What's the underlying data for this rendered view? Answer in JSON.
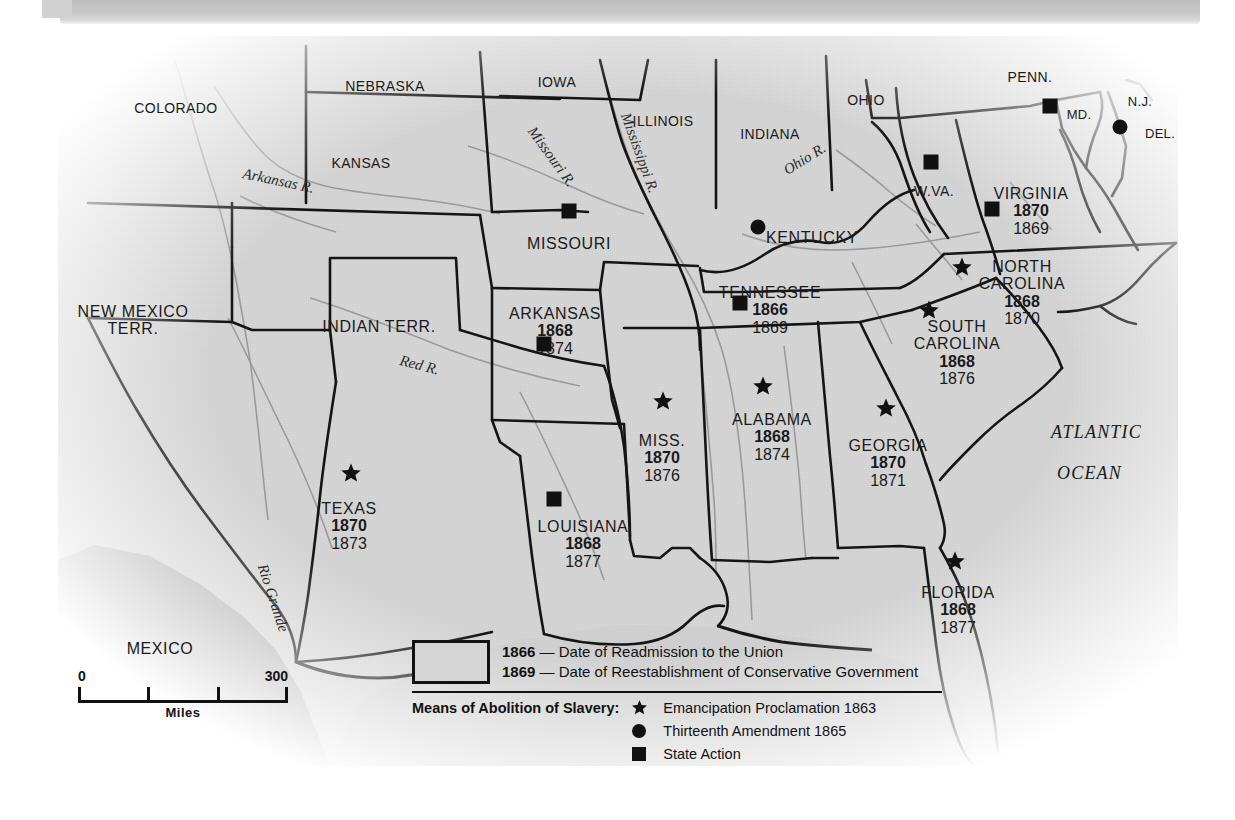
{
  "map": {
    "title_region": "Reconstruction of the South",
    "states": [
      {
        "name": "COLORADO",
        "x": 176,
        "y": 101,
        "y1": "",
        "y2": "",
        "marker": "none",
        "size": "sm"
      },
      {
        "name": "NEBRASKA",
        "x": 385,
        "y": 79,
        "y1": "",
        "y2": "",
        "marker": "none",
        "size": "sm"
      },
      {
        "name": "KANSAS",
        "x": 361,
        "y": 156,
        "y1": "",
        "y2": "",
        "marker": "none",
        "size": "sm"
      },
      {
        "name": "IOWA",
        "x": 557,
        "y": 75,
        "y1": "",
        "y2": "",
        "marker": "none",
        "size": "sm"
      },
      {
        "name": "ILLINOIS",
        "x": 663,
        "y": 114,
        "y1": "",
        "y2": "",
        "marker": "none",
        "size": "sm"
      },
      {
        "name": "INDIANA",
        "x": 770,
        "y": 127,
        "y1": "",
        "y2": "",
        "marker": "none",
        "size": "sm"
      },
      {
        "name": "OHIO",
        "x": 866,
        "y": 93,
        "y1": "",
        "y2": "",
        "marker": "none",
        "size": "sm"
      },
      {
        "name": "PENN.",
        "x": 1030,
        "y": 70,
        "y1": "",
        "y2": "",
        "marker": "none",
        "size": "sm"
      },
      {
        "name": "N.J.",
        "x": 1140,
        "y": 95,
        "y1": "",
        "y2": "",
        "marker": "none",
        "size": "xs"
      },
      {
        "name": "MD.",
        "x": 1079,
        "y": 108,
        "y1": "",
        "y2": "",
        "marker": "square",
        "mx": 1050,
        "my": 106,
        "size": "xs"
      },
      {
        "name": "DEL.",
        "x": 1160,
        "y": 127,
        "y1": "",
        "y2": "",
        "marker": "circle",
        "mx": 1120,
        "my": 127,
        "size": "xs"
      },
      {
        "name": "MISSOURI",
        "x": 569,
        "y": 235,
        "y1": "",
        "y2": "",
        "marker": "square",
        "mx": 569,
        "my": 211,
        "size": "nm"
      },
      {
        "name": "W.VA.",
        "x": 934,
        "y": 184,
        "y1": "",
        "y2": "",
        "marker": "square",
        "mx": 931,
        "my": 162,
        "size": "sm"
      },
      {
        "name": "VIRGINIA",
        "x": 1031,
        "y": 185,
        "y1": "1870",
        "y2": "1869",
        "marker": "square",
        "mx": 992,
        "my": 209,
        "size": "nm"
      },
      {
        "name": "KENTUCKY",
        "x": 812,
        "y": 229,
        "y1": "",
        "y2": "",
        "marker": "circle",
        "mx": 758,
        "my": 227,
        "size": "nm"
      },
      {
        "name": "NEW MEXICO",
        "x": 133,
        "y": 303,
        "y1": "",
        "y2": "",
        "marker": "none",
        "size": "nm",
        "name2": "TERR."
      },
      {
        "name": "INDIAN TERR.",
        "x": 379,
        "y": 318,
        "y1": "",
        "y2": "",
        "marker": "none",
        "size": "nm"
      },
      {
        "name": "ARKANSAS",
        "x": 555,
        "y": 305,
        "y1": "1868",
        "y2": "1874",
        "marker": "square",
        "mx": 544,
        "my": 344,
        "size": "nm"
      },
      {
        "name": "TENNESSEE",
        "x": 770,
        "y": 284,
        "y1": "1866",
        "y2": "1869",
        "marker": "square",
        "mx": 740,
        "my": 303,
        "size": "nm"
      },
      {
        "name": "NORTH",
        "x": 1022,
        "y": 258,
        "y1": "1868",
        "y2": "1870",
        "marker": "star",
        "mx": 962,
        "my": 267,
        "size": "nm",
        "name2": "CAROLINA"
      },
      {
        "name": "SOUTH",
        "x": 957,
        "y": 318,
        "y1": "1868",
        "y2": "1876",
        "marker": "star",
        "mx": 929,
        "my": 310,
        "size": "nm",
        "name2": "CAROLINA"
      },
      {
        "name": "MISS.",
        "x": 662,
        "y": 432,
        "y1": "1870",
        "y2": "1876",
        "marker": "star",
        "mx": 663,
        "my": 401,
        "size": "nm"
      },
      {
        "name": "ALABAMA",
        "x": 772,
        "y": 411,
        "y1": "1868",
        "y2": "1874",
        "marker": "star",
        "mx": 763,
        "my": 386,
        "size": "nm"
      },
      {
        "name": "GEORGIA",
        "x": 888,
        "y": 437,
        "y1": "1870",
        "y2": "1871",
        "marker": "star",
        "mx": 886,
        "my": 408,
        "size": "nm"
      },
      {
        "name": "TEXAS",
        "x": 349,
        "y": 500,
        "y1": "1870",
        "y2": "1873",
        "marker": "star",
        "mx": 351,
        "my": 473,
        "size": "nm"
      },
      {
        "name": "LOUISIANA",
        "x": 583,
        "y": 518,
        "y1": "1868",
        "y2": "1877",
        "marker": "square",
        "mx": 554,
        "my": 499,
        "size": "nm"
      },
      {
        "name": "FLORIDA",
        "x": 958,
        "y": 584,
        "y1": "1868",
        "y2": "1877",
        "marker": "star",
        "mx": 955,
        "my": 561,
        "size": "nm"
      },
      {
        "name": "MEXICO",
        "x": 160,
        "y": 640,
        "y1": "",
        "y2": "",
        "marker": "none",
        "size": "nm"
      }
    ],
    "rivers": [
      {
        "label": "Arkansas R.",
        "x": 243,
        "y": 165,
        "rot": 12
      },
      {
        "label": "Missouri R.",
        "x": 531,
        "y": 120,
        "rot": 54
      },
      {
        "label": "Mississippi R.",
        "x": 625,
        "y": 105,
        "rot": 70
      },
      {
        "label": "Ohio R.",
        "x": 785,
        "y": 163,
        "rot": -32
      },
      {
        "label": "Red R.",
        "x": 400,
        "y": 352,
        "rot": 14
      },
      {
        "label": "Rio Grande",
        "x": 262,
        "y": 556,
        "rot": 72
      }
    ],
    "ocean_labels": [
      {
        "label": "ATLANTIC",
        "x": 1051,
        "y": 422
      },
      {
        "label": "OCEAN",
        "x": 1057,
        "y": 463
      }
    ]
  },
  "scale": {
    "zero": "0",
    "max": "300",
    "unit": "Miles"
  },
  "legend": {
    "readmission_year": "1866",
    "readmission_text": "— Date of Readmission to the Union",
    "conservative_year": "1869",
    "conservative_text": "— Date of Reestablishment of Conservative Government",
    "means_title": "Means of Abolition of Slavery:",
    "items": [
      {
        "glyph": "star",
        "label": "Emancipation Proclamation 1863"
      },
      {
        "glyph": "circle",
        "label": "Thirteenth Amendment 1865"
      },
      {
        "glyph": "square",
        "label": "State Action"
      }
    ]
  },
  "colors": {
    "land": "#d7d7d7",
    "water": "#a8a8a8",
    "ink": "#111111",
    "paper": "#ffffff"
  }
}
